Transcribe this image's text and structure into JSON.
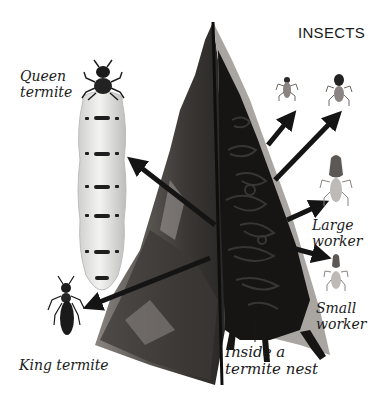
{
  "header": {
    "section_title": "INSECTS"
  },
  "illustration": {
    "subject": "Termite colony castes and nest cross-section",
    "colors": {
      "mound_outer": "#6e6a66",
      "mound_dark": "#2a2826",
      "mound_interior": "#161514",
      "mound_edge_light": "#a9a5a1",
      "arrow": "#141414",
      "queen_abdomen": "#e6e6e4",
      "queen_band": "#1e1e1e",
      "insect_body": "#8a8582",
      "background": "#ffffff"
    }
  },
  "labels": {
    "queen": "Queen\ntermite",
    "king": "King termite",
    "large_worker": "Large\nworker",
    "small_worker": "Small\nworker",
    "nest": "Inside a\ntermite nest"
  }
}
